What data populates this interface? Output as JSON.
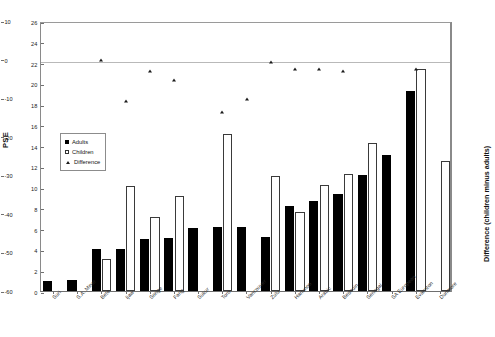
{
  "chart_data": {
    "type": "bar",
    "title": "",
    "subtitle": "",
    "xlabel": "",
    "ylabel": "PSE",
    "ylabel_secondary": "Difference (children minus adults)",
    "ylim": [
      0,
      26
    ],
    "yticks": [
      0,
      2,
      4,
      6,
      8,
      10,
      12,
      14,
      16,
      18,
      20,
      22,
      24,
      26
    ],
    "ylim_secondary": [
      -60,
      10
    ],
    "yticks_secondary": [
      10,
      0,
      -10,
      -20,
      -30,
      -40,
      -50,
      -60
    ],
    "grid": false,
    "legend_position": "inner-left",
    "legend": [
      {
        "name": "Adults",
        "marker": "filled-square",
        "color": "#000000"
      },
      {
        "name": "Children",
        "marker": "open-square",
        "color": "#ffffff"
      },
      {
        "name": "Difference",
        "marker": "triangle",
        "color": "#1a1a1a"
      }
    ],
    "categories": [
      "Suri",
      "S.A. Miner",
      "Bete",
      "Ijaw",
      "Songe",
      "Fang",
      "Sukur",
      "Toro",
      "Vancouver",
      "Zulu",
      "Hanunoo",
      "Arabic",
      "Bedouin",
      "Senegal",
      "SA European",
      "Evanston",
      "Dunmore"
    ],
    "series": [
      {
        "name": "Adults",
        "values": [
          1.0,
          1.05,
          4.05,
          4.05,
          5.05,
          5.1,
          6.1,
          6.15,
          6.15,
          5.2,
          8.2,
          8.7,
          9.3,
          11.2,
          13.1,
          19.3,
          null
        ]
      },
      {
        "name": "Children",
        "values": [
          null,
          null,
          3.05,
          10.1,
          7.1,
          9.15,
          null,
          15.1,
          null,
          11.1,
          7.6,
          10.2,
          11.3,
          14.3,
          null,
          21.4,
          12.5
        ]
      },
      {
        "name": "Difference",
        "axis": "secondary",
        "values": [
          null,
          null,
          0.5,
          -10.2,
          -2.5,
          -4.8,
          null,
          -13.0,
          -9.8,
          0.0,
          -1.8,
          -1.8,
          -2.5,
          null,
          null,
          -2.0,
          null
        ]
      }
    ]
  }
}
